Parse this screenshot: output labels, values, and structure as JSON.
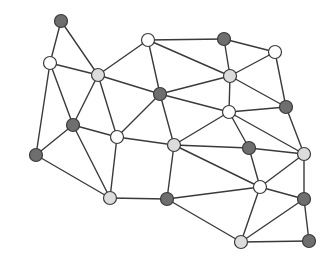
{
  "diagram": {
    "type": "undirected-graph",
    "title": "",
    "colors": {
      "dark": "#6e6e6e",
      "light": "#dcdcdc",
      "white": "#ffffff",
      "edge": "#3a3a3a",
      "outline": "#3a3a3a"
    },
    "nodes": [
      {
        "id": 0,
        "shade": "dark"
      },
      {
        "id": 1,
        "shade": "white"
      },
      {
        "id": 2,
        "shade": "light"
      },
      {
        "id": 3,
        "shade": "white"
      },
      {
        "id": 4,
        "shade": "dark"
      },
      {
        "id": 5,
        "shade": "white"
      },
      {
        "id": 6,
        "shade": "dark"
      },
      {
        "id": 7,
        "shade": "light"
      },
      {
        "id": 8,
        "shade": "white"
      },
      {
        "id": 9,
        "shade": "dark"
      },
      {
        "id": 10,
        "shade": "dark"
      },
      {
        "id": 11,
        "shade": "white"
      },
      {
        "id": 12,
        "shade": "light"
      },
      {
        "id": 13,
        "shade": "dark"
      },
      {
        "id": 14,
        "shade": "light"
      },
      {
        "id": 15,
        "shade": "dark"
      },
      {
        "id": 16,
        "shade": "light"
      },
      {
        "id": 17,
        "shade": "dark"
      },
      {
        "id": 18,
        "shade": "white"
      },
      {
        "id": 19,
        "shade": "dark"
      },
      {
        "id": 20,
        "shade": "light"
      },
      {
        "id": 21,
        "shade": "dark"
      }
    ],
    "edges": [
      [
        0,
        1
      ],
      [
        0,
        2
      ],
      [
        1,
        2
      ],
      [
        1,
        10
      ],
      [
        1,
        15
      ],
      [
        2,
        3
      ],
      [
        2,
        6
      ],
      [
        2,
        10
      ],
      [
        2,
        11
      ],
      [
        3,
        4
      ],
      [
        3,
        6
      ],
      [
        3,
        7
      ],
      [
        4,
        7
      ],
      [
        4,
        5
      ],
      [
        5,
        7
      ],
      [
        5,
        9
      ],
      [
        6,
        7
      ],
      [
        6,
        11
      ],
      [
        6,
        12
      ],
      [
        6,
        8
      ],
      [
        7,
        8
      ],
      [
        7,
        9
      ],
      [
        8,
        9
      ],
      [
        8,
        12
      ],
      [
        8,
        13
      ],
      [
        8,
        14
      ],
      [
        9,
        14
      ],
      [
        10,
        11
      ],
      [
        10,
        15
      ],
      [
        10,
        16
      ],
      [
        11,
        12
      ],
      [
        11,
        16
      ],
      [
        12,
        13
      ],
      [
        12,
        17
      ],
      [
        12,
        18
      ],
      [
        13,
        14
      ],
      [
        13,
        18
      ],
      [
        14,
        18
      ],
      [
        14,
        19
      ],
      [
        15,
        16
      ],
      [
        16,
        17
      ],
      [
        17,
        18
      ],
      [
        17,
        20
      ],
      [
        18,
        19
      ],
      [
        18,
        20
      ],
      [
        19,
        20
      ],
      [
        19,
        21
      ],
      [
        20,
        21
      ]
    ]
  }
}
